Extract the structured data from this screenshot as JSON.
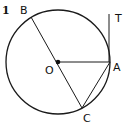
{
  "problem_number": "1",
  "points": {
    "O": {
      "label": "O",
      "x": 58,
      "y": 62
    },
    "A": {
      "label": "A",
      "x": 110,
      "y": 62
    },
    "B": {
      "label": "B",
      "x": 31,
      "y": 17
    },
    "C": {
      "label": "C",
      "x": 82,
      "y": 108
    },
    "T": {
      "label": "T",
      "x": 109,
      "y": 14
    }
  },
  "circle": {
    "cx": 58,
    "cy": 62,
    "r": 52
  },
  "segments": [
    "BC (diameter through O)",
    "OA",
    "AC",
    "AT (tangent at A)"
  ],
  "colors": {
    "stroke": "#1a1a1a",
    "background": "#ffffff"
  }
}
